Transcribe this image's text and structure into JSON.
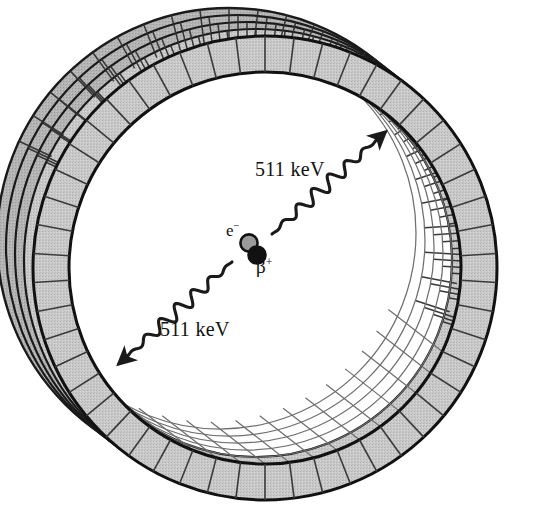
{
  "figure": {
    "name": "pet-detector-ring-annihilation",
    "background_color": "#ffffff",
    "width": 541,
    "height": 522
  },
  "labels": {
    "gamma_upper": "511 keV",
    "gamma_lower": "511 keV",
    "electron": "e",
    "electron_charge": "−",
    "positron": "β",
    "positron_charge": "+"
  },
  "colors": {
    "detector_fill": "#c8c8c8",
    "detector_fill_shadow": "#b4b4b4",
    "outline": "#1a1a1a",
    "segment_line": "#3a3a3a",
    "bore_grid_line": "#6e6e6e",
    "electron_fill": "#9a9a9a",
    "positron_fill": "#111111",
    "photon_stroke": "#1a1a1a",
    "background": "#ffffff"
  },
  "geometry": {
    "center_x": 265,
    "center_y": 268,
    "front_ring_outer_radius": 232,
    "front_ring_inner_radius": 196,
    "segment_count": 50,
    "rear_ring_count": 5,
    "rear_ring_offset_x": -9,
    "rear_ring_offset_y": -7,
    "bore_row_count": 5,
    "annihilation_x": 252,
    "annihilation_y": 248,
    "photon_angle_upper_deg": -42,
    "photon_angle_lower_deg": 138,
    "photon_wave_count": 7,
    "photon_amplitude": 7
  },
  "chart_data": {
    "type": "diagram",
    "elements": [
      {
        "name": "detector-ring-cylinder",
        "description": "Segmented scintillator detector ring shown in oblique perspective with 5 receding ring layers"
      },
      {
        "name": "inner-bore-grid",
        "description": "White grid of detector elements on far inner wall of the bore, visible on lower-left arc"
      },
      {
        "name": "electron",
        "symbol": "e-",
        "charge": -1
      },
      {
        "name": "positron",
        "symbol": "b+",
        "charge": 1
      },
      {
        "name": "annihilation-photon-1",
        "energy_kev": 511,
        "direction_deg": -42
      },
      {
        "name": "annihilation_photon-2",
        "energy_kev": 511,
        "direction_deg": 138
      }
    ],
    "annotations": [
      "511 keV",
      "511 keV",
      "e-",
      "b+"
    ]
  }
}
